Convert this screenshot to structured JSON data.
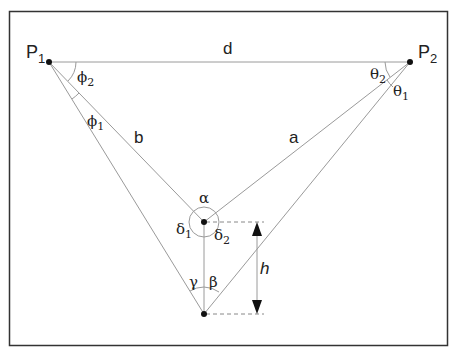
{
  "diagram": {
    "colors": {
      "frame": "#333333",
      "line": "#9a9a9a",
      "point": "#111111",
      "text": "#222222",
      "dashed": "#888888"
    },
    "points": {
      "p1": {
        "label": "P",
        "subscript": "1",
        "x": 49,
        "y": 62
      },
      "p2": {
        "label": "P",
        "subscript": "2",
        "x": 410,
        "y": 62
      },
      "center": {
        "x": 204,
        "y": 222
      },
      "bottom": {
        "x": 204,
        "y": 314
      }
    },
    "segments": {
      "d": "d",
      "a": "a",
      "b": "b",
      "h": "h"
    },
    "angles": {
      "phi1": {
        "symbol": "ϕ",
        "subscript": "1"
      },
      "phi2": {
        "symbol": "ϕ",
        "subscript": "2"
      },
      "theta1": {
        "symbol": "θ",
        "subscript": "1"
      },
      "theta2": {
        "symbol": "θ",
        "subscript": "2"
      },
      "alpha": {
        "symbol": "α"
      },
      "beta": {
        "symbol": "β"
      },
      "gamma": {
        "symbol": "γ"
      },
      "delta1": {
        "symbol": "δ",
        "subscript": "1"
      },
      "delta2": {
        "symbol": "δ",
        "subscript": "2"
      }
    }
  }
}
